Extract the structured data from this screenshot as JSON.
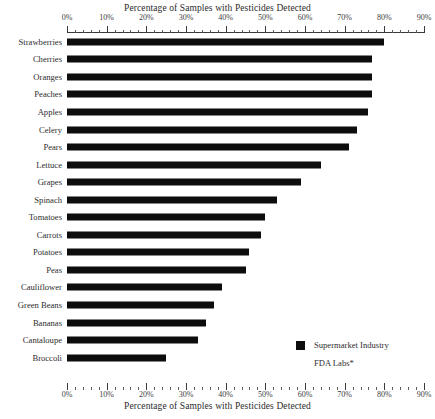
{
  "chart_data": {
    "type": "bar",
    "orientation": "horizontal",
    "title": "",
    "top_axis_title": "Percentage of Samples with Pesticides Detected",
    "bottom_axis_title": "Percentage of Samples with Pesticides Detected",
    "xlabel": "Percentage of Samples with Pesticides Detected",
    "ylabel": "",
    "xlim": [
      0,
      90
    ],
    "grid": false,
    "tick_labels": [
      "0%",
      "10%",
      "20%",
      "30%",
      "40%",
      "50%",
      "60%",
      "70%",
      "80%",
      "90%"
    ],
    "tick_values": [
      0,
      10,
      20,
      30,
      40,
      50,
      60,
      70,
      80,
      90
    ],
    "minor_tick_step": 2,
    "legend_position": "bottom-right",
    "legend": [
      {
        "label": "Supermarket Industry",
        "swatch": "filled",
        "color": "#0d0d0d"
      },
      {
        "label": "FDA Labs*",
        "swatch": "empty",
        "color": "#ffffff"
      }
    ],
    "series": [
      {
        "name": "Supermarket Industry",
        "color": "#0d0d0d",
        "values": [
          80,
          77,
          77,
          77,
          76,
          73,
          71,
          64,
          59,
          53,
          50,
          49,
          46,
          45,
          39,
          37,
          35,
          33,
          25
        ]
      }
    ],
    "categories": [
      "Strawberries",
      "Cherries",
      "Oranges",
      "Peaches",
      "Apples",
      "Celery",
      "Pears",
      "Lettuce",
      "Grapes",
      "Spinach",
      "Tomatoes",
      "Carrots",
      "Potatoes",
      "Peas",
      "Cauliflower",
      "Green Beans",
      "Bananas",
      "Cantaloupe",
      "Broccoli"
    ],
    "values": [
      80,
      77,
      77,
      77,
      76,
      73,
      71,
      64,
      59,
      53,
      50,
      49,
      46,
      45,
      39,
      37,
      35,
      33,
      25
    ]
  }
}
